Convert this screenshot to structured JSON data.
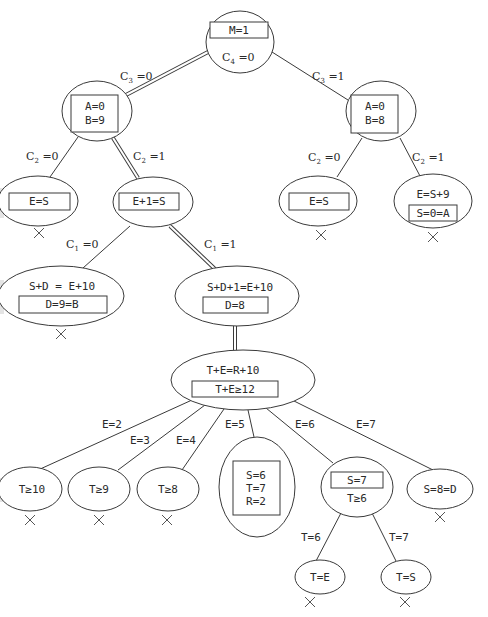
{
  "diagram": {
    "title": "",
    "colors": {
      "line": "#3a3a3a",
      "text": "#2a2a2a",
      "background": "#ffffff"
    },
    "nodes": {
      "root": {
        "box": "M=1",
        "text": "C",
        "sub": "4",
        "text_after": " =0"
      },
      "n_a0b9": {
        "box_line1": "A=0",
        "box_line2": "B=9"
      },
      "n_a0b8": {
        "box_line1": "A=0",
        "box_line2": "B=8"
      },
      "n_es_left": {
        "box": "E=S",
        "failed": true
      },
      "n_e1s": {
        "box": "E+1=S"
      },
      "n_es_right": {
        "box": "E=S",
        "failed": true
      },
      "n_es9": {
        "text": "E=S+9",
        "box": "S=0=A",
        "failed": true
      },
      "n_sde10": {
        "text": "S+D = E+10",
        "box": "D=9=B",
        "failed": true
      },
      "n_sd1e10": {
        "text": "S+D+1=E+10",
        "box": "D=8"
      },
      "n_ter10": {
        "text": "T+E=R+10",
        "box": "T+E≥12"
      },
      "n_t10": {
        "text": "T≥10",
        "failed": true
      },
      "n_t9": {
        "text": "T≥9",
        "failed": true
      },
      "n_t8": {
        "text": "T≥8",
        "failed": true
      },
      "n_solution": {
        "box_line1": "S=6",
        "box_line2": "T=7",
        "box_line3": "R=2"
      },
      "n_s7": {
        "box": "S=7",
        "text": "T≥6"
      },
      "n_s8d": {
        "text": "S=8=D",
        "failed": true
      },
      "n_te": {
        "text": "T=E",
        "failed": true
      },
      "n_ts": {
        "text": "T=S",
        "failed": true
      }
    },
    "edges": {
      "c3_0": {
        "var": "C",
        "sub": "3",
        "val": " =0"
      },
      "c3_1": {
        "var": "C",
        "sub": "3",
        "val": " =1"
      },
      "c2_0_left": {
        "var": "C",
        "sub": "2",
        "val": " =0"
      },
      "c2_1_left": {
        "var": "C",
        "sub": "2",
        "val": " =1"
      },
      "c2_0_right": {
        "var": "C",
        "sub": "2",
        "val": " =0"
      },
      "c2_1_right": {
        "var": "C",
        "sub": "2",
        "val": " =1"
      },
      "c1_0": {
        "var": "C",
        "sub": "1",
        "val": " =0"
      },
      "c1_1": {
        "var": "C",
        "sub": "1",
        "val": " =1"
      },
      "e2": {
        "label": "E=2"
      },
      "e3": {
        "label": "E=3"
      },
      "e4": {
        "label": "E=4"
      },
      "e5": {
        "label": "E=5"
      },
      "e6": {
        "label": "E=6"
      },
      "e7": {
        "label": "E=7"
      },
      "t6": {
        "label": "T=6"
      },
      "t7": {
        "label": "T=7"
      }
    },
    "fail_marker": "×"
  }
}
